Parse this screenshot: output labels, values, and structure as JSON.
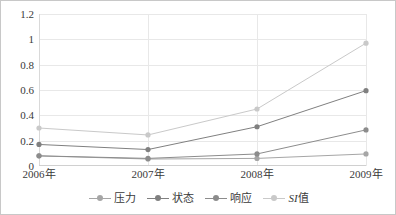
{
  "chart_data": {
    "type": "line",
    "title": "",
    "subtitle": "",
    "xlabel": "",
    "ylabel": "",
    "categories": [
      "2006年",
      "2007年",
      "2008年",
      "2009年"
    ],
    "ylim": [
      0,
      1.2
    ],
    "yticks": [
      "0",
      "0.2",
      "0.4",
      "0.6",
      "0.8",
      "1",
      "1.2"
    ],
    "ytick_values": [
      0,
      0.2,
      0.4,
      0.6,
      0.8,
      1,
      1.2
    ],
    "grid": true,
    "legend_position": "bottom",
    "markers": "circle",
    "series": [
      {
        "name": "压力",
        "values": [
          0.08,
          0.055,
          0.06,
          0.095
        ],
        "color": "#a6a6a6"
      },
      {
        "name": "状态",
        "values": [
          0.17,
          0.13,
          0.31,
          0.595
        ],
        "color": "#808080"
      },
      {
        "name": "响应",
        "values": [
          0.08,
          0.06,
          0.095,
          0.285
        ],
        "color": "#8c8c8c"
      },
      {
        "name": "SI值",
        "values": [
          0.3,
          0.245,
          0.45,
          0.97
        ],
        "color": "#c9c9c9"
      }
    ]
  },
  "legend": {
    "items": [
      {
        "label": "压力",
        "italic_prefix": "",
        "rest": "压力"
      },
      {
        "label": "状态",
        "italic_prefix": "",
        "rest": "状态"
      },
      {
        "label": "响应",
        "italic_prefix": "",
        "rest": "响应"
      },
      {
        "label": "SI值",
        "italic_prefix": "SI",
        "rest": "值"
      }
    ]
  },
  "style": {
    "border_color": "#c8c8c8",
    "gridline_color": "#e8e8e8",
    "text_color": "#3a3a3a",
    "background": "#ffffff"
  }
}
